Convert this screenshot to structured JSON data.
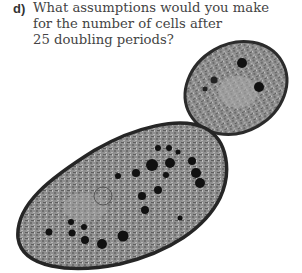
{
  "question": {
    "label": "d)",
    "lines": [
      "What assumptions would you make",
      "for the number of cells after",
      "25 doubling periods?"
    ]
  },
  "figure": {
    "colors": {
      "membrane": "#2a2a2a",
      "cytoplasm": "#8a8a8a",
      "organelles": "#111111",
      "background": "#ffffff"
    }
  }
}
